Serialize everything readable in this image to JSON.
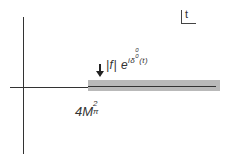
{
  "diagram": {
    "type": "complex-plane cut diagram",
    "plane_label": "t",
    "cut_label": {
      "prefix": "|f| e",
      "exponent": "iδ",
      "exp_super": "0",
      "exp_sub": "0",
      "exp_arg": "(t)"
    },
    "threshold_label": {
      "base": "4M",
      "sup": "2",
      "sub": "π"
    },
    "colors": {
      "axis": "#333333",
      "cut_band": "#b9b9b9",
      "background": "#ffffff"
    }
  }
}
